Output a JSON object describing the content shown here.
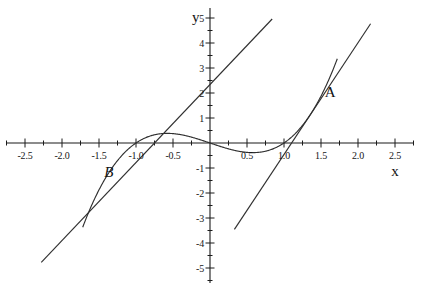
{
  "chart_data": {
    "type": "line",
    "title": "",
    "xlabel": "x",
    "ylabel": "y",
    "xlim": [
      -2.75,
      2.75
    ],
    "ylim": [
      -5.6,
      5.4
    ],
    "grid": false,
    "legend": "none",
    "axis_origin_px": [
      210,
      143
    ],
    "px_per_unit": {
      "x": 74,
      "y": 25
    },
    "x_major_ticks": [
      -2.5,
      -2.0,
      -1.5,
      -1.0,
      -0.5,
      0.5,
      1.0,
      1.5,
      2.0,
      2.5
    ],
    "x_major_tick_labels": [
      "-2.5",
      "-2.0",
      "-1.5",
      "-1.0",
      "-0.5",
      "0.5",
      "1.0",
      "1.5",
      "2.0",
      "2.5"
    ],
    "x_minor_tick_step": 0.25,
    "y_major_ticks": [
      5,
      4,
      3,
      2,
      1,
      -1,
      -2,
      -3,
      -4,
      -5
    ],
    "y_major_tick_labels": [
      "5",
      "4",
      "3",
      "2",
      "1",
      "-1",
      "-2",
      "-3",
      "-4",
      "-5"
    ],
    "y_minor_tick_step": 0.5,
    "series": [
      {
        "name": "cubic-curve",
        "kind": "curve",
        "equation": "y = x^3 - x",
        "color": "#303030",
        "x_range": [
          -1.72,
          1.72
        ],
        "features": {
          "roots": [
            -1,
            0,
            1
          ],
          "local_max": {
            "x": -0.577,
            "y": 0.385
          },
          "local_min": {
            "x": 0.577,
            "y": -0.385
          }
        }
      },
      {
        "name": "tangent-line-at-A",
        "kind": "line",
        "equation": "y = 4.47x - 4.93",
        "color": "#303030",
        "tangent_point": {
          "label": "A",
          "x": 1.349,
          "y": 1.106
        },
        "slope": 4.47,
        "intercept": -4.93,
        "x_range": [
          0.33,
          2.17
        ]
      },
      {
        "name": "tangent-line-at-B",
        "kind": "line",
        "equation": "y = 3.12x + 2.34",
        "color": "#303030",
        "tangent_point": {
          "label": "B",
          "x": -1.17,
          "y": -0.43
        },
        "slope": 3.12,
        "intercept": 2.34,
        "x_range": [
          -2.28,
          0.84
        ]
      }
    ],
    "annotations": [
      {
        "text": "A",
        "x": 1.55,
        "y": 2.0,
        "style": "upright"
      },
      {
        "text": "B",
        "x": -1.43,
        "y": -1.2,
        "style": "italic"
      }
    ]
  },
  "axes": {
    "x_axis_label": "x",
    "y_axis_label": "y"
  },
  "labels": {
    "point_a": "A",
    "point_b": "B"
  },
  "colors": {
    "curve": "#303030",
    "axis": "#1b1b1b",
    "background": "#ffffff",
    "text": "#161616"
  }
}
